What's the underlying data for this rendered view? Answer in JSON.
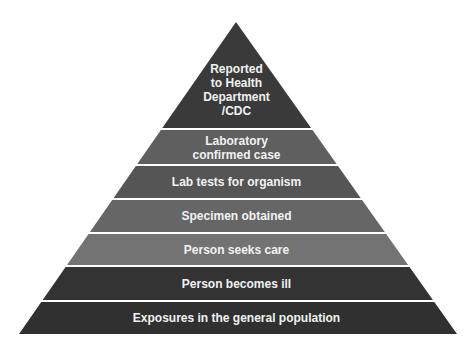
{
  "diagram": {
    "type": "pyramid",
    "levels": [
      {
        "label_lines": [
          "Reported",
          "to Health",
          "Department",
          "/CDC"
        ],
        "color": "#3a3a3a"
      },
      {
        "label_lines": [
          "Laboratory",
          "confirmed case"
        ],
        "color": "#5f5f5f"
      },
      {
        "label_lines": [
          "Lab tests for organism"
        ],
        "color": "#555555"
      },
      {
        "label_lines": [
          "Specimen obtained"
        ],
        "color": "#666666"
      },
      {
        "label_lines": [
          "Person seeks care"
        ],
        "color": "#737373"
      },
      {
        "label_lines": [
          "Person becomes ill"
        ],
        "color": "#333333"
      },
      {
        "label_lines": [
          "Exposures in the general population"
        ],
        "color": "#303030"
      }
    ]
  }
}
